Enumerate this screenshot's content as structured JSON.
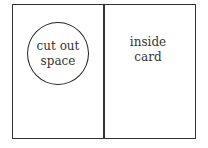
{
  "diagram": {
    "left_panel": {
      "circle_label_lines": [
        "cut out",
        "space"
      ]
    },
    "right_panel": {
      "label_lines": [
        "inside",
        "card"
      ]
    },
    "colors": {
      "outline": "#333333",
      "background": "#ffffff",
      "text": "#333333"
    }
  }
}
